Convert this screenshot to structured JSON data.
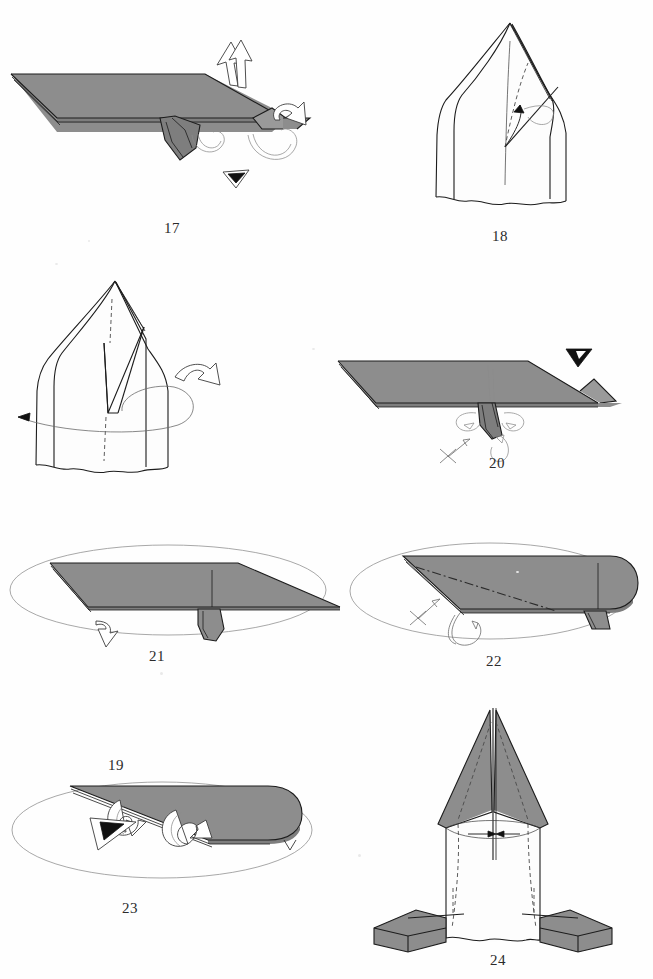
{
  "page": {
    "kind": "origami-instruction-page",
    "width": 653,
    "height": 979,
    "background_color": "#ffffff",
    "ink_color": "#1c1c1c",
    "paper_front_color": "#8d8d8d",
    "paper_back_color": "#fdfdfd",
    "total_steps": 8
  },
  "steps": [
    {
      "number": "17",
      "label_x": 152,
      "label_y": 192,
      "view": "side view of flattened model, point left",
      "symbols": [
        "valley-fold-arrow",
        "rotate-arrow",
        "push-here-arrow",
        "sink-arrow"
      ]
    },
    {
      "number": "18",
      "label_x": 480,
      "label_y": 228,
      "view": "front view of standing model with pointed top",
      "symbols": [
        "fold-arrow",
        "dashed-fold-line"
      ]
    },
    {
      "number": "19",
      "label_x": 96,
      "label_y": 495,
      "view": "front view of standing model, flap opened",
      "symbols": [
        "turn-over-arrow",
        "rotate-model-arrow",
        "dashed-center-line"
      ]
    },
    {
      "number": "20",
      "label_x": 477,
      "label_y": 458,
      "view": "side view of flattened model, point right",
      "symbols": [
        "solid-push-arrow",
        "reverse-fold-arrows",
        "x-mark"
      ]
    },
    {
      "number": "21",
      "label_x": 137,
      "label_y": 650,
      "view": "side view inside rotation ellipse, small flap below",
      "symbols": [
        "rotation-ellipse",
        "open-arrow"
      ]
    },
    {
      "number": "22",
      "label_x": 474,
      "label_y": 663,
      "view": "side view inside rotation ellipse, dash-dot fold line",
      "symbols": [
        "rotation-ellipse",
        "dash-dot-fold",
        "x-mark",
        "curl-arrow"
      ]
    },
    {
      "number": "23",
      "label_x": 110,
      "label_y": 908,
      "view": "side view inside rotation ellipse, two curl arrows",
      "symbols": [
        "rotation-ellipse",
        "double-curl-arrow",
        "solid-push-arrow"
      ]
    },
    {
      "number": "24",
      "label_x": 478,
      "label_y": 955,
      "view": "front view of finished rocket-like form with feet",
      "symbols": [
        "dashed-fold-lines",
        "inward-arrows",
        "ellipse-guide"
      ]
    }
  ]
}
